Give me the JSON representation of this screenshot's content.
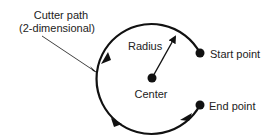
{
  "diagram": {
    "type": "circular-interpolation",
    "labels": {
      "cutter_path_line1": "Cutter path",
      "cutter_path_line2": "(2-dimensional)",
      "radius": "Radius",
      "start_point": "Start point",
      "center": "Center",
      "end_point": "End point"
    },
    "colors": {
      "stroke": "#111111",
      "text": "#222222",
      "background": "#ffffff"
    }
  }
}
